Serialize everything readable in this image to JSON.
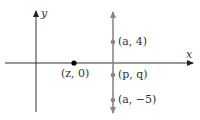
{
  "diagram": {
    "type": "coordinate-plane",
    "axes": {
      "x_label": "x",
      "y_label": "y"
    },
    "vertical_line": {
      "color": "#888888",
      "description": "vertical line x = a with arrows at both ends"
    },
    "points": [
      {
        "id": "z0",
        "label": "(z, 0)",
        "color": "#000000"
      },
      {
        "id": "a4",
        "label": "(a, 4)",
        "color": "#888888"
      },
      {
        "id": "pq",
        "label": "(p, q)",
        "color": "#888888"
      },
      {
        "id": "am5",
        "label": "(a, −5)",
        "color": "#888888"
      }
    ]
  }
}
